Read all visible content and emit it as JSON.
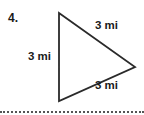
{
  "problem": {
    "number": "4."
  },
  "triangle": {
    "shape": "equilateral-triangle",
    "vertices": [
      [
        59,
        13
      ],
      [
        135,
        67
      ],
      [
        59,
        101
      ]
    ],
    "stroke_color": "#2a2a2a",
    "sides": {
      "left": "3 mi",
      "top": "3 mi",
      "bottom": "3 mi"
    }
  },
  "divider": {
    "style": "dotted",
    "color": "#555555"
  }
}
